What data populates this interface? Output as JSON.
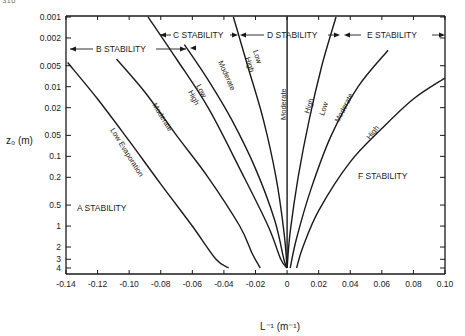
{
  "page_number": "316",
  "chart_data": {
    "type": "line",
    "title": "",
    "xlabel": "L⁻¹ (m⁻¹)",
    "ylabel": "z₀ (m)",
    "xlim": [
      -0.14,
      0.1
    ],
    "ylim_log": [
      0.001,
      4
    ],
    "y_inverted": true,
    "y_scale": "log",
    "x_ticks": [
      "-0.14",
      "-0.12",
      "-0.10",
      "-0.08",
      "-0.06",
      "-0.04",
      "-0.02",
      "0",
      "0.02",
      "0.04",
      "0.06",
      "0.08",
      "0.10"
    ],
    "x_tick_values": [
      -0.14,
      -0.12,
      -0.1,
      -0.08,
      -0.06,
      -0.04,
      -0.02,
      0,
      0.02,
      0.04,
      0.06,
      0.08,
      0.1
    ],
    "y_ticks": [
      "0.001",
      "0.002",
      "0.005",
      "0.01",
      "0.02",
      "0.05",
      "0.1",
      "0.2",
      "0.5",
      "1",
      "2",
      "3",
      "4"
    ],
    "y_tick_values": [
      0.001,
      0.002,
      0.005,
      0.01,
      0.02,
      0.05,
      0.1,
      0.2,
      0.5,
      1,
      2,
      3,
      4
    ],
    "grid": false,
    "series": [
      {
        "name": "Low Evaporation (A/B boundary)",
        "label": "Low Evaporation",
        "points": [
          [
            -0.139,
            0.0045
          ],
          [
            -0.12,
            0.015
          ],
          [
            -0.1,
            0.06
          ],
          [
            -0.08,
            0.25
          ],
          [
            -0.06,
            1.0
          ],
          [
            -0.045,
            3.0
          ],
          [
            -0.037,
            4
          ]
        ]
      },
      {
        "name": "Moderate (B)",
        "label": "Moderate",
        "points": [
          [
            -0.108,
            0.004
          ],
          [
            -0.09,
            0.012
          ],
          [
            -0.07,
            0.05
          ],
          [
            -0.05,
            0.2
          ],
          [
            -0.03,
            1.0
          ],
          [
            -0.022,
            2.5
          ],
          [
            -0.017,
            4
          ]
        ]
      },
      {
        "name": "B/C boundary Low/High",
        "label": "Low / High",
        "points": [
          [
            -0.088,
            0.001
          ],
          [
            -0.07,
            0.004
          ],
          [
            -0.05,
            0.02
          ],
          [
            -0.03,
            0.15
          ],
          [
            -0.012,
            1.0
          ],
          [
            -0.004,
            3.0
          ],
          [
            0,
            4
          ]
        ]
      },
      {
        "name": "Moderate (C)",
        "label": "Moderate",
        "points": [
          [
            -0.065,
            0.0025
          ],
          [
            -0.05,
            0.008
          ],
          [
            -0.035,
            0.03
          ],
          [
            -0.02,
            0.15
          ],
          [
            -0.008,
            0.8
          ],
          [
            -0.002,
            3
          ],
          [
            0,
            4
          ]
        ]
      },
      {
        "name": "C/D boundary Low/High",
        "label": "Low / High",
        "points": [
          [
            -0.034,
            0.001
          ],
          [
            -0.025,
            0.005
          ],
          [
            -0.015,
            0.03
          ],
          [
            -0.007,
            0.2
          ],
          [
            -0.002,
            1.2
          ],
          [
            0,
            4
          ]
        ]
      },
      {
        "name": "Moderate (D)",
        "label": "Moderate",
        "points": [
          [
            0,
            0.001
          ],
          [
            0,
            4
          ]
        ]
      },
      {
        "name": "D/E boundary High/Low",
        "label": "High / Low",
        "points": [
          [
            0.031,
            0.001
          ],
          [
            0.022,
            0.005
          ],
          [
            0.014,
            0.03
          ],
          [
            0.007,
            0.2
          ],
          [
            0.002,
            1.2
          ],
          [
            0,
            4
          ]
        ]
      },
      {
        "name": "Moderate (E)",
        "label": "Moderate",
        "points": [
          [
            0.064,
            0.003
          ],
          [
            0.045,
            0.01
          ],
          [
            0.028,
            0.05
          ],
          [
            0.015,
            0.3
          ],
          [
            0.006,
            1.5
          ],
          [
            0.002,
            4
          ]
        ]
      },
      {
        "name": "E/F boundary High",
        "label": "High",
        "points": [
          [
            0.1,
            0.0075
          ],
          [
            0.08,
            0.015
          ],
          [
            0.06,
            0.04
          ],
          [
            0.04,
            0.12
          ],
          [
            0.02,
            0.6
          ],
          [
            0.01,
            2
          ],
          [
            0.006,
            4
          ]
        ]
      }
    ],
    "annotations": [
      {
        "text": "A STABILITY",
        "x": -0.125,
        "y": 0.3
      },
      {
        "text": "B STABILITY",
        "x": -0.11,
        "y": 0.0065,
        "arrows": "both"
      },
      {
        "text": "C STABILITY",
        "x": -0.055,
        "y": 0.0015,
        "arrows": "both"
      },
      {
        "text": "D STABILITY",
        "x": 0.005,
        "y": 0.0015,
        "arrows": "both"
      },
      {
        "text": "E STABILITY",
        "x": 0.06,
        "y": 0.0015,
        "arrows": "both"
      },
      {
        "text": "F STABILITY",
        "x": 0.06,
        "y": 0.15
      }
    ]
  },
  "labels": {
    "ylabel": "z₀ (m)",
    "xlabel": "L⁻¹ (m⁻¹)",
    "a_stability": "A STABILITY",
    "b_stability": "B STABILITY",
    "c_stability": "C STABILITY",
    "d_stability": "D STABILITY",
    "e_stability": "E STABILITY",
    "f_stability": "F STABILITY",
    "low_evaporation": "Low Evaporation",
    "moderate": "Moderate",
    "low": "Low",
    "high": "High"
  }
}
